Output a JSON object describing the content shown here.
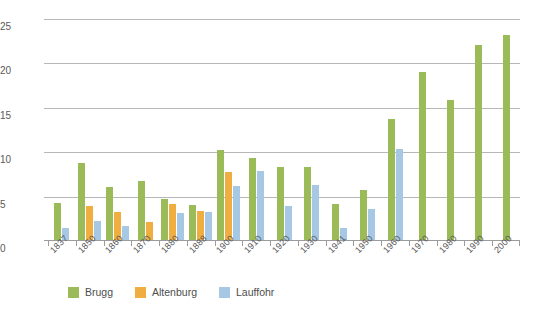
{
  "chart_data": {
    "type": "bar",
    "title": "",
    "xlabel": "",
    "ylabel": "",
    "ylim": [
      0,
      25
    ],
    "yticks": [
      0,
      5,
      10,
      15,
      20,
      25
    ],
    "grid": true,
    "legend_position": "bottom",
    "categories": [
      "1837",
      "1850",
      "1860",
      "1870",
      "1880",
      "1888",
      "1900",
      "1910",
      "1920",
      "1930",
      "1941",
      "1950",
      "1960",
      "1970",
      "1980",
      "1990",
      "2000"
    ],
    "series": [
      {
        "name": "Brugg",
        "color": "#9bbb59",
        "values": [
          4.2,
          8.7,
          6.0,
          6.6,
          4.6,
          3.9,
          10.1,
          9.2,
          8.2,
          8.2,
          4.0,
          5.6,
          13.6,
          18.9,
          15.8,
          22.0,
          23.1
        ]
      },
      {
        "name": "Altenburg",
        "color": "#f0ad40",
        "values": [
          0,
          3.8,
          3.2,
          2.0,
          4.1,
          3.3,
          7.7,
          0,
          0,
          0,
          0,
          0,
          0,
          0,
          0,
          0,
          0
        ]
      },
      {
        "name": "Lauffohr",
        "color": "#a6c8e4",
        "values": [
          1.3,
          2.1,
          1.6,
          0,
          3.0,
          3.2,
          6.1,
          7.8,
          3.8,
          6.2,
          1.3,
          3.5,
          10.3,
          0,
          0,
          0,
          0
        ]
      }
    ]
  },
  "axis": {
    "y_tick_labels": [
      "25",
      "20",
      "15",
      "10",
      "5",
      "0"
    ]
  },
  "legend": {
    "items": [
      {
        "label": "Brugg",
        "key": "brugg"
      },
      {
        "label": "Altenburg",
        "key": "altenburg"
      },
      {
        "label": "Lauffohr",
        "key": "lauffohr"
      }
    ]
  }
}
